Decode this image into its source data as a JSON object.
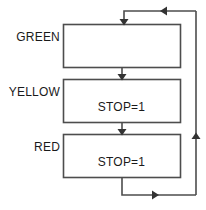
{
  "diagram": {
    "type": "flowchart",
    "stroke_color": "#4d4d4d",
    "text_color": "#1a1a1a",
    "background_color": "#ffffff",
    "states": [
      {
        "id": "green",
        "label": "GREEN",
        "box_text": "",
        "box": {
          "x": 63,
          "y": 24,
          "w": 117,
          "h": 43
        }
      },
      {
        "id": "yellow",
        "label": "YELLOW",
        "box_text": "STOP=1",
        "box": {
          "x": 63,
          "y": 79,
          "w": 117,
          "h": 43
        }
      },
      {
        "id": "red",
        "label": "RED",
        "box_text": "STOP=1",
        "box": {
          "x": 63,
          "y": 134,
          "w": 117,
          "h": 43
        }
      }
    ],
    "transitions": [
      {
        "id": "green-to-yellow",
        "from": "green",
        "to": "yellow",
        "label": ""
      },
      {
        "id": "yellow-to-red",
        "from": "yellow",
        "to": "red",
        "label": ""
      },
      {
        "id": "red-to-green-loop",
        "from": "red",
        "to": "green",
        "label": ""
      },
      {
        "id": "return-branch-up",
        "from": "red",
        "to": "green",
        "label": ""
      }
    ]
  }
}
